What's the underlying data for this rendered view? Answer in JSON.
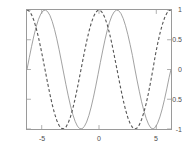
{
  "chart_data": {
    "type": "line",
    "title": "",
    "xlabel": "",
    "ylabel": "",
    "xlim": [
      -6.2832,
      6.2832
    ],
    "ylim": [
      -1,
      1
    ],
    "grid": false,
    "legend": "none",
    "background_color": "#ffffff",
    "frame_color": "#9a9a9a",
    "xticks": [
      -5,
      0,
      5
    ],
    "xtick_labels": [
      "-5",
      "0",
      "5"
    ],
    "yticks": [
      -1,
      -0.5,
      0,
      0.5,
      1
    ],
    "ytick_labels": [
      "-1",
      "-0.5",
      "0",
      "0.5",
      "1"
    ],
    "series": [
      {
        "name": "sin(x)",
        "style": "solid",
        "color": "#8a8a8a",
        "linewidth": 0.8,
        "x": [
          -6.2832,
          -6.0832,
          -5.8832,
          -5.6832,
          -5.4832,
          -5.2832,
          -5.0832,
          -4.8832,
          -4.6832,
          -4.4832,
          -4.2832,
          -4.0832,
          -3.8832,
          -3.6832,
          -3.4832,
          -3.2832,
          -3.0832,
          -2.8832,
          -2.6832,
          -2.4832,
          -2.2832,
          -2.0832,
          -1.8832,
          -1.6832,
          -1.4832,
          -1.2832,
          -1.0832,
          -0.8832,
          -0.6832,
          -0.4832,
          -0.2832,
          -0.0832,
          0.1168,
          0.3168,
          0.5168,
          0.7168,
          0.9168,
          1.1168,
          1.3168,
          1.5168,
          1.7168,
          1.9168,
          2.1168,
          2.3168,
          2.5168,
          2.7168,
          2.9168,
          3.1168,
          3.3168,
          3.5168,
          3.7168,
          3.9168,
          4.1168,
          4.3168,
          4.5168,
          4.7168,
          4.9168,
          5.1168,
          5.3168,
          5.5168,
          5.7168,
          5.9168,
          6.1168,
          6.2832
        ],
        "y": [
          0.0,
          0.1987,
          0.3894,
          0.5646,
          0.7174,
          0.8415,
          0.932,
          0.9854,
          0.9996,
          0.9738,
          0.9093,
          0.8085,
          0.6755,
          0.5155,
          0.335,
          0.1411,
          -0.0584,
          -0.2555,
          -0.4425,
          -0.6119,
          -0.7568,
          -0.8716,
          -0.9516,
          -0.9937,
          -0.9962,
          -0.9589,
          -0.8835,
          -0.7728,
          -0.6313,
          -0.4646,
          -0.2794,
          -0.0831,
          0.1165,
          0.3115,
          0.4941,
          0.657,
          0.7936,
          0.8984,
          0.967,
          0.9982,
          0.9894,
          0.9409,
          0.8551,
          0.7357,
          0.5881,
          0.4189,
          0.235,
          0.0248,
          -0.1765,
          -0.3655,
          -0.5424,
          -0.694,
          -0.8201,
          -0.9179,
          -0.9809,
          -0.9999,
          -0.9706,
          -0.9013,
          -0.7963,
          -0.6613,
          -0.5021,
          -0.3245,
          -0.1343,
          0.0
        ]
      },
      {
        "name": "cos(x)",
        "style": "dashed",
        "color": "#555555",
        "linewidth": 1.1,
        "dasharray": "3,2.2",
        "x": [
          -6.2832,
          -6.0832,
          -5.8832,
          -5.6832,
          -5.4832,
          -5.2832,
          -5.0832,
          -4.8832,
          -4.6832,
          -4.4832,
          -4.2832,
          -4.0832,
          -3.8832,
          -3.6832,
          -3.4832,
          -3.2832,
          -3.0832,
          -2.8832,
          -2.6832,
          -2.4832,
          -2.2832,
          -2.0832,
          -1.8832,
          -1.6832,
          -1.4832,
          -1.2832,
          -1.0832,
          -0.8832,
          -0.6832,
          -0.4832,
          -0.2832,
          -0.0832,
          0.1168,
          0.3168,
          0.5168,
          0.7168,
          0.9168,
          1.1168,
          1.3168,
          1.5168,
          1.7168,
          1.9168,
          2.1168,
          2.3168,
          2.5168,
          2.7168,
          2.9168,
          3.1168,
          3.3168,
          3.5168,
          3.7168,
          3.9168,
          4.1168,
          4.3168,
          4.5168,
          4.7168,
          4.9168,
          5.1168,
          5.3168,
          5.5168,
          5.7168,
          5.9168,
          6.1168,
          6.2832
        ],
        "y": [
          1.0,
          0.9801,
          0.9211,
          0.8253,
          0.6967,
          0.5403,
          0.3624,
          0.17,
          -0.0292,
          -0.2272,
          -0.4161,
          -0.5885,
          -0.7374,
          -0.8569,
          -0.9422,
          -0.99,
          -0.9983,
          -0.9668,
          -0.8968,
          -0.791,
          -0.6536,
          -0.4903,
          -0.3073,
          -0.1122,
          0.0875,
          0.2837,
          0.4685,
          0.6347,
          0.7756,
          0.8855,
          0.9602,
          0.9965,
          0.9932,
          0.9502,
          0.8695,
          0.7539,
          0.6084,
          0.4391,
          0.2508,
          0.054,
          -0.1452,
          -0.3387,
          -0.5184,
          -0.6773,
          -0.8088,
          -0.9081,
          -0.972,
          -0.9997,
          -0.9843,
          -0.9308,
          -0.8401,
          -0.72,
          -0.5723,
          -0.3968,
          -0.1946,
          0.0141,
          0.2406,
          0.4331,
          0.6049,
          0.7502,
          0.8648,
          0.9459,
          0.9909,
          1.0
        ]
      }
    ]
  },
  "axes": {
    "ytick_labels": [
      "1",
      "0.5",
      "0",
      "-0.5",
      "-1"
    ],
    "xtick_labels": [
      "-5",
      "0",
      "5"
    ]
  }
}
